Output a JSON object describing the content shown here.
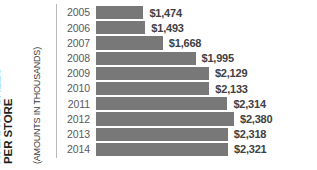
{
  "axis_title": {
    "line1": "AVERAGE SALES",
    "line2": "PER STORE",
    "sub": "(AMOUNTS IN THOUSANDS)"
  },
  "chart_data": {
    "type": "bar",
    "orientation": "horizontal",
    "title": "AVERAGE SALES PER STORE",
    "subtitle": "(AMOUNTS IN THOUSANDS)",
    "xlabel": "",
    "ylabel": "AVERAGE SALES PER STORE",
    "grid": false,
    "legend": false,
    "bar_color": "#787878",
    "value_prefix": "$",
    "axis_origin": 1000,
    "xlim": [
      1000,
      2500
    ],
    "categories": [
      "2005",
      "2006",
      "2007",
      "2008",
      "2009",
      "2010",
      "2011",
      "2012",
      "2013",
      "2014"
    ],
    "values": [
      1474,
      1493,
      1668,
      1995,
      2129,
      2133,
      2314,
      2380,
      2318,
      2321
    ],
    "value_labels": [
      "$1,474",
      "$1,493",
      "$1,668",
      "$1,995",
      "$2,129",
      "$2,133",
      "$2,314",
      "$2,380",
      "$2,318",
      "$2,321"
    ],
    "rows": [
      {
        "year": "2005",
        "value": 1474,
        "label": "$1,474"
      },
      {
        "year": "2006",
        "value": 1493,
        "label": "$1,493"
      },
      {
        "year": "2007",
        "value": 1668,
        "label": "$1,668"
      },
      {
        "year": "2008",
        "value": 1995,
        "label": "$1,995"
      },
      {
        "year": "2009",
        "value": 2129,
        "label": "$2,129"
      },
      {
        "year": "2010",
        "value": 2133,
        "label": "$2,133"
      },
      {
        "year": "2011",
        "value": 2314,
        "label": "$2,314"
      },
      {
        "year": "2012",
        "value": 2380,
        "label": "$2,380"
      },
      {
        "year": "2013",
        "value": 2318,
        "label": "$2,318"
      },
      {
        "year": "2014",
        "value": 2321,
        "label": "$2,321"
      }
    ]
  }
}
